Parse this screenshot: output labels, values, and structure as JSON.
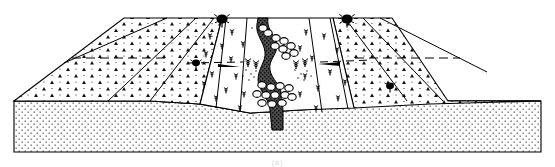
{
  "figure": {
    "type": "geologic-block-diagram",
    "width_px": 555,
    "height_px": 167,
    "background_color": "#ffffff",
    "line_color": "#000000",
    "partial_caption": "(a)"
  },
  "units": [
    {
      "id": "basement-block",
      "label": "Basement / substratum block",
      "fill_pattern": "fine-stipple",
      "fill_color": "#ffffff",
      "pattern_color": "#1a1a1a"
    },
    {
      "id": "terrace-gravels",
      "label": "Terrace gravel surfaces",
      "fill_pattern": "triangle-scree",
      "fill_color": "#ffffff",
      "pattern_color": "#111111"
    },
    {
      "id": "valley-floor",
      "label": "Vegetated valley floor",
      "fill_pattern": "none",
      "fill_color": "#ffffff"
    },
    {
      "id": "channel-fill",
      "label": "Active channel / dark infill",
      "fill_pattern": "dense-stipple",
      "fill_color": "#3a3a3a"
    },
    {
      "id": "boulder-clusters",
      "label": "Boulder and cobble clusters",
      "fill_pattern": "outlined-clasts",
      "fill_color": "#ffffff"
    }
  ],
  "symbols": [
    {
      "id": "tree-left-rim",
      "label": "Tree on left valley rim"
    },
    {
      "id": "tree-right-rim",
      "label": "Tree on right valley rim"
    },
    {
      "id": "shrub-left-slope",
      "label": "Shrub on left terrace riser"
    },
    {
      "id": "shrub-right-slope",
      "label": "Shrub on right terrace riser"
    },
    {
      "id": "herb-tufts",
      "label": "Scattered herb and grass tufts"
    },
    {
      "id": "dashed-trace",
      "label": "Dashed terrace-edge trace"
    }
  ],
  "palette": {
    "ink": "#000000",
    "channel_dark": "#3a3a3a",
    "paper": "#ffffff",
    "faint": "#d8d8d8"
  }
}
